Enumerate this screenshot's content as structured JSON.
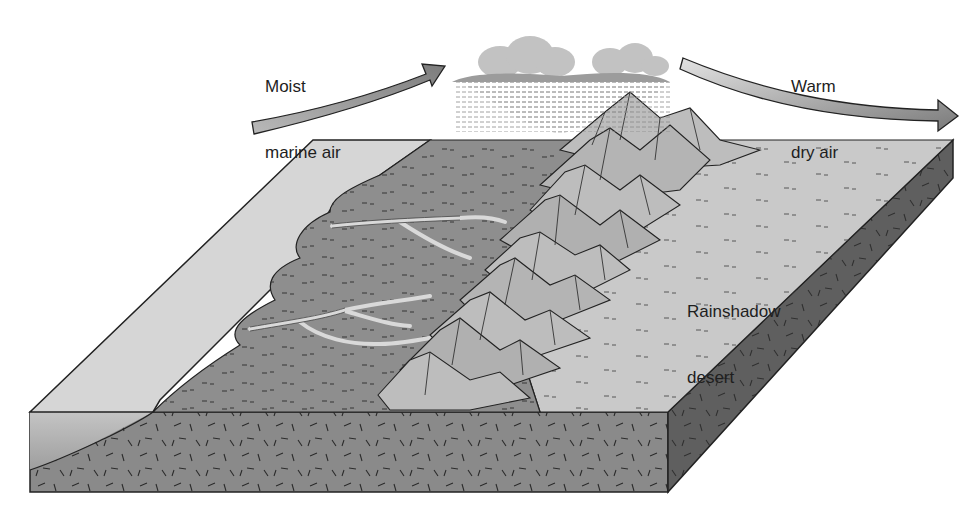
{
  "diagram": {
    "labels": {
      "moist_air_line1": "Moist",
      "moist_air_line2": "marine air",
      "dry_air_line1": "Warm",
      "dry_air_line2": "dry air",
      "desert_line1": "Rainshadow",
      "desert_line2": "desert"
    },
    "elements": [
      {
        "id": "moist-air-arrow",
        "semantic": "arrow rising from ocean toward mountains",
        "color": "#8f8f8f"
      },
      {
        "id": "rain-cloud",
        "semantic": "cloud with rain over windward slope",
        "color": "#b5b5b5"
      },
      {
        "id": "dry-air-arrow",
        "semantic": "arrow descending leeward past mountains",
        "color": "#9a9a9a"
      },
      {
        "id": "ocean",
        "semantic": "ocean surface on left of block",
        "color": "#d6d6d6"
      },
      {
        "id": "windward-land",
        "semantic": "vegetated windward coastal slope with rivers",
        "color": "#8e8e8e"
      },
      {
        "id": "mountain-range",
        "semantic": "mountain peaks",
        "color": "#bdbdbd"
      },
      {
        "id": "desert-plain",
        "semantic": "leeward rainshadow desert",
        "color": "#c9c9c9"
      },
      {
        "id": "bedrock-front",
        "semantic": "front cross-section of crust",
        "color": "#8a8a8a"
      },
      {
        "id": "bedrock-side",
        "semantic": "right cross-section of crust",
        "color": "#5f5f5f"
      }
    ],
    "colors": {
      "outline": "#222222",
      "ocean": "#d6d6d6",
      "ocean_front": "#a8a8a8",
      "land": "#8e8e8e",
      "desert": "#c9c9c9",
      "mountain": "#bdbdbd",
      "mountain_shade": "#9a9a9a",
      "bedrock_front": "#8a8a8a",
      "bedrock_side": "#5f5f5f",
      "river": "#d9d9d9",
      "cloud": "#c2c2c2",
      "cloud_shade": "#9c9c9c"
    }
  }
}
